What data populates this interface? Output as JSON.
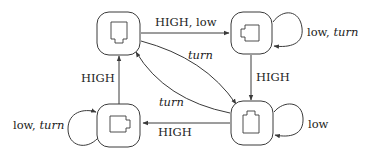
{
  "diagram": {
    "type": "state-machine",
    "colors": {
      "stroke": "#3a3a3a",
      "text": "#222222",
      "background": "#ffffff"
    },
    "nodes": [
      {
        "id": "top-left",
        "glyph": "port-notch-down"
      },
      {
        "id": "top-right",
        "glyph": "port-notch-left"
      },
      {
        "id": "bottom-left",
        "glyph": "port-notch-right"
      },
      {
        "id": "bottom-right",
        "glyph": "port-notch-up"
      }
    ],
    "edges": [
      {
        "from": "top-left",
        "to": "top-right",
        "label": {
          "plain": "HIGH, low",
          "italic": ""
        }
      },
      {
        "from": "top-right",
        "to": "top-right",
        "label": {
          "plain": "low, ",
          "italic": "turn"
        }
      },
      {
        "from": "top-right",
        "to": "bottom-right",
        "label": {
          "plain": "HIGH",
          "italic": ""
        }
      },
      {
        "from": "top-left",
        "to": "bottom-right",
        "label": {
          "plain": "",
          "italic": "turn"
        }
      },
      {
        "from": "bottom-right",
        "to": "top-left",
        "label": {
          "plain": "",
          "italic": "turn"
        }
      },
      {
        "from": "bottom-right",
        "to": "bottom-right",
        "label": {
          "plain": "low",
          "italic": ""
        }
      },
      {
        "from": "bottom-right",
        "to": "bottom-left",
        "label": {
          "plain": "HIGH",
          "italic": ""
        }
      },
      {
        "from": "bottom-left",
        "to": "bottom-left",
        "label": {
          "plain": "low, ",
          "italic": "turn"
        }
      },
      {
        "from": "bottom-left",
        "to": "top-left",
        "label": {
          "plain": "HIGH",
          "italic": ""
        }
      }
    ]
  }
}
